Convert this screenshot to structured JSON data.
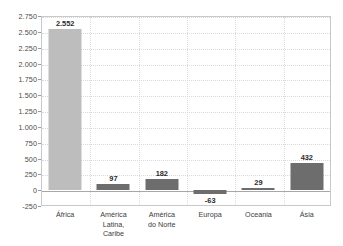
{
  "chart_data": {
    "type": "bar",
    "title": "",
    "subtitle": "",
    "xlabel": "",
    "ylabel": "",
    "categories": [
      "África",
      "América Latina, Caribe",
      "América do Norte",
      "Europa",
      "Oceania",
      "Ásia"
    ],
    "values": [
      2552,
      97,
      182,
      -63,
      29,
      432
    ],
    "value_labels": [
      "2.552",
      "97",
      "182",
      "-63",
      "29",
      "432"
    ],
    "bar_colors": [
      "#bdbdbd",
      "#6d6d6d",
      "#6d6d6d",
      "#6d6d6d",
      "#6d6d6d",
      "#6d6d6d"
    ],
    "ylim": [
      -250,
      2750
    ],
    "ytick_values": [
      2750,
      2500,
      2250,
      2000,
      1750,
      1500,
      1250,
      1000,
      750,
      500,
      250,
      0,
      -250
    ],
    "ytick_labels": [
      "2.750",
      "2.500",
      "2.250",
      "2.000",
      "1.750",
      "1.500",
      "1.250",
      "1.000",
      "750",
      "500",
      "250",
      "0",
      "-250"
    ],
    "grid": true,
    "grid_orientation": "both",
    "legend": false,
    "legend_position": "none",
    "decimal_separator_style": "period-thousands",
    "annotations": []
  },
  "axis": {
    "zero_line_value": 0,
    "grid_color": "#d9d9d9",
    "zero_line_color": "#a8a8a8",
    "frame_color": "#c9c9c9",
    "tick_text_color": "#4a4a4a",
    "category_text_color": "#3d3d3d",
    "value_text_color": "#2b2b2b"
  },
  "category_label_lines": [
    [
      "África"
    ],
    [
      "América Latina,",
      "Caribe"
    ],
    [
      "América",
      "do Norte"
    ],
    [
      "Europa"
    ],
    [
      "Oceania"
    ],
    [
      "Ásia"
    ]
  ]
}
